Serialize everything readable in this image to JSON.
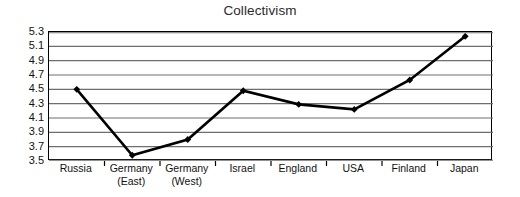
{
  "chart_data": {
    "type": "line",
    "title": "Collectivism",
    "xlabel": "",
    "ylabel": "",
    "categories": [
      "Russia",
      "Germany (East)",
      "Germany (West)",
      "Israel",
      "England",
      "USA",
      "Finland",
      "Japan"
    ],
    "category_lines": [
      [
        "Russia"
      ],
      [
        "Germany",
        "(East)"
      ],
      [
        "Germany",
        "(West)"
      ],
      [
        "Israel"
      ],
      [
        "England"
      ],
      [
        "USA"
      ],
      [
        "Finland"
      ],
      [
        "Japan"
      ]
    ],
    "values": [
      4.5,
      3.58,
      3.8,
      4.48,
      4.29,
      4.22,
      4.63,
      5.24
    ],
    "series": [
      {
        "name": "Collectivism",
        "values": [
          4.5,
          3.58,
          3.8,
          4.48,
          4.29,
          4.22,
          4.63,
          5.24
        ]
      }
    ],
    "ylim": [
      3.5,
      5.3
    ],
    "ytick_labels": [
      "5.3",
      "5.1",
      "4.9",
      "4.7",
      "4.5",
      "4.3",
      "4.1",
      "3.9",
      "3.7",
      "3.5"
    ],
    "ytick_values": [
      5.3,
      5.1,
      4.9,
      4.7,
      4.5,
      4.3,
      4.1,
      3.9,
      3.7,
      3.5
    ],
    "grid": true,
    "grid_orientation": "horizontal",
    "legend": false,
    "legend_position": "none",
    "marker": "diamond",
    "line_color": "#000000",
    "marker_color": "#000000",
    "grid_color": "#6e6e6e",
    "frame_color": "#000000",
    "background_color": "#ffffff"
  }
}
